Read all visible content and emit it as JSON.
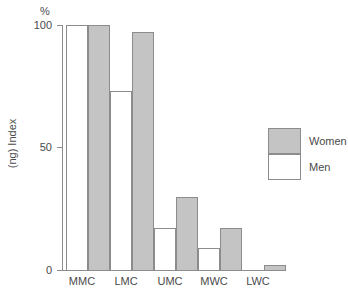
{
  "chart_data": {
    "type": "bar",
    "title": "",
    "xlabel": "",
    "ylabel": "(ng) Index",
    "unit_label": "%",
    "categories": [
      "MMC",
      "LMC",
      "UMC",
      "MWC",
      "LWC"
    ],
    "ylim": [
      0,
      100
    ],
    "yticks": [
      0,
      50,
      100
    ],
    "ytick_labels": [
      "0",
      "50",
      "100"
    ],
    "grid": false,
    "legend_position": "right",
    "series": [
      {
        "name": "Women",
        "color": "#c4c4c4",
        "values": [
          100,
          97,
          30,
          17,
          2
        ]
      },
      {
        "name": "Men",
        "color": "#ffffff",
        "values": [
          100,
          73,
          17,
          9,
          0
        ]
      }
    ]
  },
  "axis": {
    "unit": "%",
    "title": "(ng) Index",
    "ticks": [
      {
        "label": "100",
        "value": 100
      },
      {
        "label": "50",
        "value": 50
      },
      {
        "label": "0",
        "value": 0
      }
    ]
  },
  "categories": [
    {
      "label": "MMC"
    },
    {
      "label": "LMC"
    },
    {
      "label": "UMC"
    },
    {
      "label": "MWC"
    },
    {
      "label": "LWC"
    }
  ],
  "legend": {
    "women_label": "Women",
    "men_label": "Men"
  }
}
